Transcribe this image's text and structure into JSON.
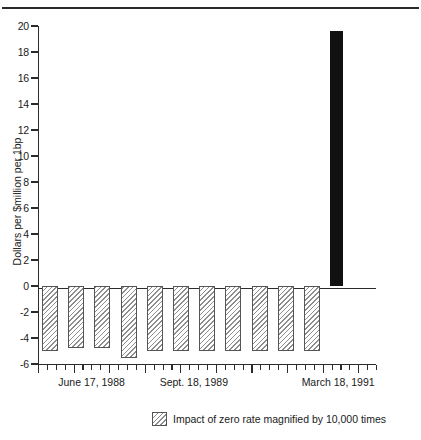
{
  "chart_data": {
    "type": "bar",
    "title": "",
    "xlabel": "",
    "ylabel": "Dollars per $million per 1bp",
    "ylim": [
      -6,
      20
    ],
    "ytick_labels": [
      "20",
      "18",
      "16",
      "14",
      "12",
      "10",
      "8",
      "6",
      "4",
      "2",
      "0",
      "-2",
      "-4",
      "-6"
    ],
    "ytick_values": [
      20,
      18,
      16,
      14,
      12,
      10,
      8,
      6,
      4,
      2,
      0,
      -2,
      -4,
      -6
    ],
    "grid": false,
    "legend_position": "bottom-center",
    "x_tick_count": 39,
    "x_axis_labels": [
      {
        "text": "June 17, 1988",
        "x_fraction": 0.06
      },
      {
        "text": "Sept. 18, 1989",
        "x_fraction": 0.36
      },
      {
        "text": "March 18, 1991",
        "x_fraction": 0.78
      }
    ],
    "series": [
      {
        "name": "Impact of zero rate magnified by 10,000 times",
        "style": "hatched",
        "color": "#8d8d8d",
        "values": [
          -5.0,
          -4.8,
          -4.8,
          -5.5,
          -5.0,
          -5.0,
          -5.0,
          -5.0,
          -5.0,
          -5.0,
          -5.0
        ]
      },
      {
        "name": "Final period value",
        "style": "solid",
        "color": "#111111",
        "values": [
          19.6
        ]
      }
    ],
    "bars": [
      {
        "index": 0,
        "value": -5.0,
        "style": "hatched"
      },
      {
        "index": 1,
        "value": -4.8,
        "style": "hatched"
      },
      {
        "index": 2,
        "value": -4.8,
        "style": "hatched"
      },
      {
        "index": 3,
        "value": -5.5,
        "style": "hatched"
      },
      {
        "index": 4,
        "value": -5.0,
        "style": "hatched"
      },
      {
        "index": 5,
        "value": -5.0,
        "style": "hatched"
      },
      {
        "index": 6,
        "value": -5.0,
        "style": "hatched"
      },
      {
        "index": 7,
        "value": -5.0,
        "style": "hatched"
      },
      {
        "index": 8,
        "value": -5.0,
        "style": "hatched"
      },
      {
        "index": 9,
        "value": -5.0,
        "style": "hatched"
      },
      {
        "index": 10,
        "value": -5.0,
        "style": "hatched"
      },
      {
        "index": 11,
        "value": 19.6,
        "style": "solid"
      }
    ]
  },
  "legend": {
    "label": "Impact of zero rate magnified by 10,000 times"
  }
}
